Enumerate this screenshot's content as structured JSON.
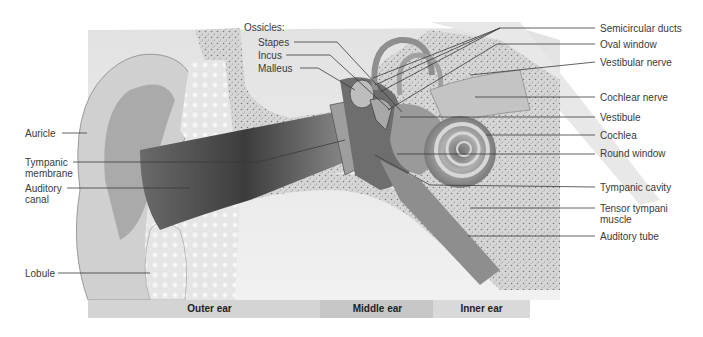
{
  "labels_left": [
    {
      "id": "auricle",
      "text": "Auricle"
    },
    {
      "id": "tympanic-membrane",
      "line1": "Tympanic",
      "line2": "membrane"
    },
    {
      "id": "auditory-canal",
      "line1": "Auditory",
      "line2": "canal"
    },
    {
      "id": "lobule",
      "text": "Lobule"
    }
  ],
  "ossicles": {
    "heading": "Ossicles:",
    "items": [
      "Stapes",
      "Incus",
      "Malleus"
    ]
  },
  "labels_right": [
    {
      "id": "semicircular-ducts",
      "text": "Semicircular ducts"
    },
    {
      "id": "oval-window",
      "text": "Oval window"
    },
    {
      "id": "vestibular-nerve",
      "text": "Vestibular nerve"
    },
    {
      "id": "cochlear-nerve",
      "text": "Cochlear nerve"
    },
    {
      "id": "vestibule",
      "text": "Vestibule"
    },
    {
      "id": "cochlea",
      "text": "Cochlea"
    },
    {
      "id": "round-window",
      "text": "Round window"
    },
    {
      "id": "tympanic-cavity",
      "text": "Tympanic cavity"
    },
    {
      "id": "tensor-tympani",
      "line1": "Tensor tympani",
      "line2": "muscle"
    },
    {
      "id": "auditory-tube",
      "text": "Auditory tube"
    }
  ],
  "regions": [
    {
      "id": "outer",
      "text": "Outer ear"
    },
    {
      "id": "middle",
      "text": "Middle ear"
    },
    {
      "id": "inner",
      "text": "Inner ear"
    }
  ],
  "colors": {
    "leader_line": "#3a3a3a",
    "region_bar_outer": "#d4d4d4",
    "region_bar_middle": "#c6c6c6",
    "region_bar_inner": "#d9d9d9",
    "bone": "#cfcfcf",
    "canal": "#4a4a4a"
  }
}
